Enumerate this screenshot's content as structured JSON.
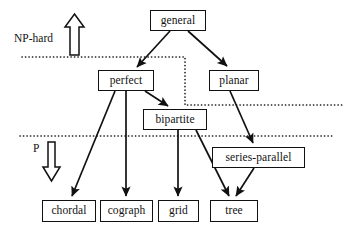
{
  "diagram": {
    "colors": {
      "ink": "#111111",
      "background": "#ffffff",
      "boundary": "#111111"
    },
    "nodes": [
      {
        "id": "general",
        "label": "general",
        "x": 150,
        "y": 10,
        "w": 56,
        "h": 21
      },
      {
        "id": "perfect",
        "label": "perfect",
        "x": 98,
        "y": 70,
        "w": 56,
        "h": 21
      },
      {
        "id": "planar",
        "label": "planar",
        "x": 209,
        "y": 70,
        "w": 50,
        "h": 21
      },
      {
        "id": "bipartite",
        "label": "bipartite",
        "x": 143,
        "y": 109,
        "w": 64,
        "h": 21
      },
      {
        "id": "series-parallel",
        "label": "series-parallel",
        "x": 212,
        "y": 147,
        "w": 93,
        "h": 21
      },
      {
        "id": "chordal",
        "label": "chordal",
        "x": 42,
        "y": 200,
        "w": 54,
        "h": 22
      },
      {
        "id": "cograph",
        "label": "cograph",
        "x": 100,
        "y": 200,
        "w": 53,
        "h": 22
      },
      {
        "id": "grid",
        "label": "grid",
        "x": 158,
        "y": 200,
        "w": 41,
        "h": 22
      },
      {
        "id": "tree",
        "label": "tree",
        "x": 210,
        "y": 200,
        "w": 48,
        "h": 22
      }
    ],
    "edges": [
      {
        "from": "general",
        "to": "perfect"
      },
      {
        "from": "general",
        "to": "planar"
      },
      {
        "from": "perfect",
        "to": "bipartite"
      },
      {
        "from": "perfect",
        "to": "chordal"
      },
      {
        "from": "perfect",
        "to": "cograph"
      },
      {
        "from": "planar",
        "to": "series-parallel"
      },
      {
        "from": "bipartite",
        "to": "grid"
      },
      {
        "from": "bipartite",
        "to": "tree"
      },
      {
        "from": "series-parallel",
        "to": "tree"
      }
    ],
    "boundaries": [
      {
        "id": "np-hard-boundary",
        "style": "dotted"
      },
      {
        "id": "p-boundary",
        "style": "dotted"
      }
    ],
    "regions": [
      {
        "id": "np-hard",
        "label": "NP-hard",
        "arrow": "up",
        "label_x": 14,
        "label_y": 33
      },
      {
        "id": "p",
        "label": "P",
        "arrow": "down",
        "label_x": 33,
        "label_y": 143
      }
    ]
  }
}
